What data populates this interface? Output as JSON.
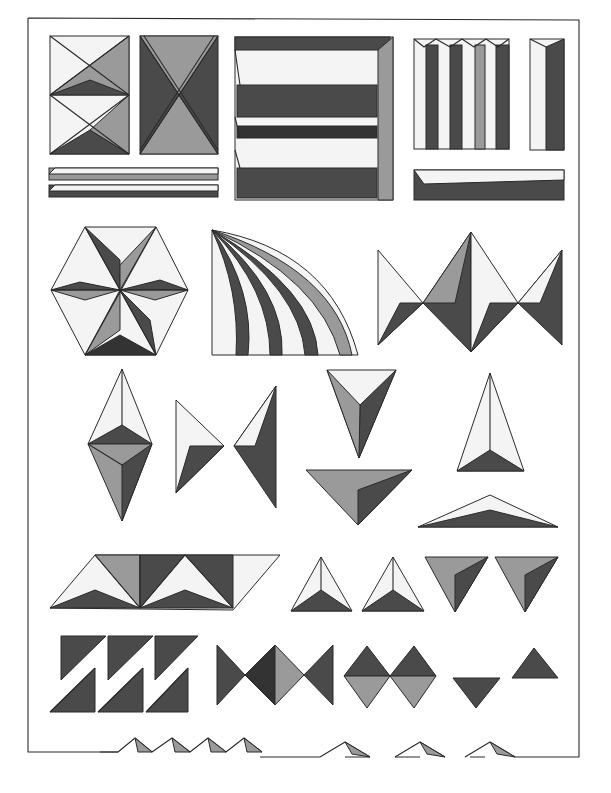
{
  "plate": {
    "description": "Engraved plate of faceted geometric ornament patterns (pyramidal, prismatic and triangular relief motifs) inside a rectangular frame",
    "frame": {
      "x": 28,
      "y": 18,
      "width": 551,
      "height": 739
    },
    "colors": {
      "paper": "#ffffff",
      "ink": "#2a2a2a",
      "shade_dark": "#4a4a4a",
      "shade_mid": "#9a9a9a",
      "shade_light": "#f4f4f4"
    },
    "rows": [
      {
        "name": "row-1",
        "figures": [
          "split-pyramid-square",
          "x-pyramid-square",
          "horizontal-prism-panel",
          "vertical-fluted-panel",
          "single-vertical-prism",
          "horizontal-bar-pair",
          "horizontal-bar"
        ]
      },
      {
        "name": "row-2",
        "figures": [
          "hexagonal-star-rosette",
          "quarter-fan-flutes",
          "bowtie-pyramid-band"
        ]
      },
      {
        "name": "row-3",
        "figures": [
          "double-pyramid-diamond",
          "right-pointing-pyramid",
          "left-pointing-pyramid",
          "inverted-triangle-pyramid",
          "wide-inverted-triangle",
          "upright-tall-pyramid",
          "flat-wide-pyramid"
        ]
      },
      {
        "name": "row-4",
        "figures": [
          "parallelogram-pyramid-band",
          "upright-triangle-pyramid-a",
          "upright-triangle-pyramid-b",
          "inverted-triangle-pyramid-a",
          "inverted-triangle-pyramid-b"
        ]
      },
      {
        "name": "row-5",
        "figures": [
          "zigzag-sawtooth-band",
          "bowtie-pyramid-strip",
          "double-diamond-pair",
          "small-inverted-triangle",
          "small-upright-triangle"
        ]
      },
      {
        "name": "row-6",
        "figures": [
          "profile-zigzag-a",
          "profile-zigzag-b"
        ]
      }
    ],
    "caption": ""
  }
}
